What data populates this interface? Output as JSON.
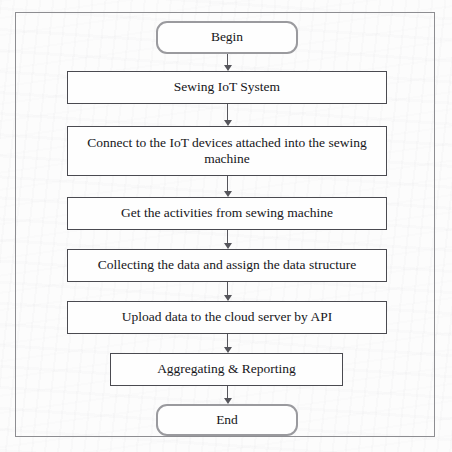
{
  "diagram": {
    "type": "flowchart",
    "orientation": "vertical-top-down",
    "title_text": "",
    "colors": {
      "page_background": "#fcfcfc",
      "outer_frame_border": "#8d8d91",
      "terminator_border": "#9a9a9e",
      "process_border": "#4a4a50",
      "connector": "#55555b",
      "text": "#16161a",
      "node_fill": "#fefefe"
    },
    "nodes": [
      {
        "id": "begin",
        "shape": "terminator",
        "label": "Begin",
        "lines": [
          "Begin"
        ],
        "x": 156,
        "y": 21,
        "width": 142,
        "height": 33
      },
      {
        "id": "sewing-iot-system",
        "shape": "process",
        "label": "Sewing IoT System",
        "lines": [
          "Sewing IoT System"
        ],
        "x": 67,
        "y": 71,
        "width": 320,
        "height": 33
      },
      {
        "id": "connect-iot-devices",
        "shape": "process",
        "label": "Connect to the IoT devices attached into the sewing machine",
        "lines": [
          "Connect to the IoT devices attached into the sewing",
          "machine"
        ],
        "x": 67,
        "y": 126,
        "width": 320,
        "height": 50
      },
      {
        "id": "get-activities",
        "shape": "process",
        "label": "Get the activities from sewing machine",
        "lines": [
          "Get the activities from sewing machine"
        ],
        "x": 67,
        "y": 197,
        "width": 320,
        "height": 33
      },
      {
        "id": "collect-assign-structure",
        "shape": "process",
        "label": "Collecting the data and assign the data structure",
        "lines": [
          "Collecting the data and assign the data structure"
        ],
        "x": 67,
        "y": 249,
        "width": 320,
        "height": 33
      },
      {
        "id": "upload-cloud-api",
        "shape": "process",
        "label": "Upload data to the cloud server by API",
        "lines": [
          "Upload data to the cloud server by API"
        ],
        "x": 67,
        "y": 301,
        "width": 320,
        "height": 33
      },
      {
        "id": "aggregating-reporting",
        "shape": "process",
        "label": "Aggregating & Reporting",
        "lines": [
          "Aggregating & Reporting"
        ],
        "x": 110,
        "y": 353,
        "width": 233,
        "height": 33
      },
      {
        "id": "end",
        "shape": "terminator",
        "label": "End",
        "lines": [
          "End"
        ],
        "x": 156,
        "y": 404,
        "width": 142,
        "height": 32
      }
    ],
    "connectors": [
      {
        "id": "begin-to-sewing-iot-system",
        "from": "begin",
        "to": "sewing-iot-system",
        "x": 227,
        "y": 54,
        "length": 17,
        "arrowhead": "down"
      },
      {
        "id": "sewing-iot-system-to-connect-iot-devices",
        "from": "sewing-iot-system",
        "to": "connect-iot-devices",
        "x": 227,
        "y": 104,
        "length": 22,
        "arrowhead": "down"
      },
      {
        "id": "connect-iot-devices-to-get-activities",
        "from": "connect-iot-devices",
        "to": "get-activities",
        "x": 227,
        "y": 176,
        "length": 21,
        "arrowhead": "down"
      },
      {
        "id": "get-activities-to-collect-assign-structure",
        "from": "get-activities",
        "to": "collect-assign-structure",
        "x": 227,
        "y": 230,
        "length": 19,
        "arrowhead": "down"
      },
      {
        "id": "collect-assign-structure-to-upload-cloud-api",
        "from": "collect-assign-structure",
        "to": "upload-cloud-api",
        "x": 227,
        "y": 282,
        "length": 19,
        "arrowhead": "down"
      },
      {
        "id": "upload-cloud-api-to-aggregating-reporting",
        "from": "upload-cloud-api",
        "to": "aggregating-reporting",
        "x": 227,
        "y": 334,
        "length": 19,
        "arrowhead": "down"
      },
      {
        "id": "aggregating-reporting-to-end",
        "from": "aggregating-reporting",
        "to": "end",
        "x": 227,
        "y": 386,
        "length": 18,
        "arrowhead": "down"
      }
    ]
  }
}
